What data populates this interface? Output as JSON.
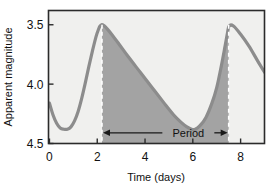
{
  "chart_data": {
    "type": "line",
    "title": "",
    "xlabel": "Time (days)",
    "ylabel": "Apparent magnitude",
    "xlim": [
      -0.04,
      9.0
    ],
    "ylim": [
      4.5,
      3.38
    ],
    "y_inverted": true,
    "grid": false,
    "legend": null,
    "xticks": [
      0,
      2,
      4,
      6,
      8
    ],
    "xtick_labels": [
      "0",
      "2",
      "4",
      "6",
      "8"
    ],
    "yticks": [
      3.5,
      4.0,
      4.5
    ],
    "ytick_labels": [
      "3.5",
      "4.0",
      "4.5"
    ],
    "series": [
      {
        "name": "Light curve",
        "color": "#8c8c8c",
        "x": [
          0.0,
          0.15,
          0.3,
          0.45,
          0.6,
          0.75,
          0.9,
          1.05,
          1.2,
          1.35,
          1.5,
          1.65,
          1.8,
          1.95,
          2.05,
          2.12,
          2.18,
          2.22,
          2.35,
          2.6,
          2.9,
          3.3,
          3.8,
          4.3,
          4.8,
          5.2,
          5.5,
          5.75,
          5.95,
          6.1,
          6.3,
          6.55,
          6.8,
          7.0,
          7.2,
          7.35,
          7.45,
          7.52,
          7.7,
          8.0,
          8.35,
          8.7,
          9.0
        ],
        "y": [
          4.16,
          4.26,
          4.33,
          4.37,
          4.38,
          4.38,
          4.36,
          4.31,
          4.23,
          4.12,
          3.99,
          3.85,
          3.72,
          3.6,
          3.54,
          3.51,
          3.5,
          3.5,
          3.52,
          3.58,
          3.66,
          3.77,
          3.9,
          4.03,
          4.16,
          4.26,
          4.32,
          4.36,
          4.38,
          4.38,
          4.35,
          4.28,
          4.16,
          4.03,
          3.84,
          3.68,
          3.57,
          3.51,
          3.51,
          3.58,
          3.68,
          3.8,
          3.9
        ]
      }
    ],
    "annotations": [
      {
        "name": "period-marker",
        "label": "Period",
        "x_start": 2.2,
        "x_end": 7.5,
        "y": 4.41,
        "style": "double-arrow"
      },
      {
        "name": "period-start-line",
        "x": 2.2,
        "style": "dashed-vertical"
      },
      {
        "name": "period-end-line",
        "x": 7.5,
        "style": "dashed-vertical"
      }
    ],
    "shaded_region": {
      "name": "period-shading",
      "x_start": 2.2,
      "x_end": 7.5,
      "color": "#a3a3a3"
    },
    "colors": {
      "plot_background": "#f0f0ee",
      "shade_fill": "#a3a3a3",
      "curve": "#8c8c8c",
      "frame": "#2b2b2b",
      "text": "#111111",
      "dashed_line": "#ffffff"
    }
  },
  "axis": {
    "xlabel": "Time (days)",
    "ylabel": "Apparent magnitude"
  },
  "annotation": {
    "period_label": "Period"
  }
}
